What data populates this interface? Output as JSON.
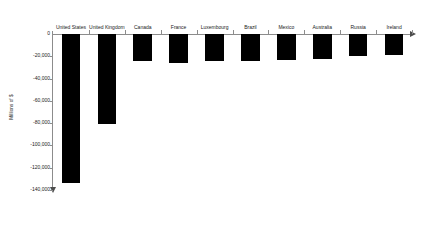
{
  "chart_data": {
    "type": "bar",
    "title": "",
    "subtitle": "",
    "xlabel": "",
    "ylabel": "Millions of $",
    "orientation": "vertical",
    "grid": false,
    "legend": false,
    "legend_position": "none",
    "ylim": [
      -140000,
      0
    ],
    "ytick_step": 20000,
    "categories": [
      "United States",
      "United Kingdom",
      "Canada",
      "France",
      "Luxembourg",
      "Brazil",
      "Mexico",
      "Australia",
      "Russia",
      "Ireland"
    ],
    "values": [
      -134000,
      -81000,
      -24000,
      -26000,
      -24000,
      -24000,
      -23000,
      -22000,
      -20000,
      -19000
    ],
    "ytick_labels": [
      "0",
      "-20,000",
      "-40,000",
      "-60,000",
      "-80,000",
      "-100,000",
      "-120,000",
      "-140,000"
    ],
    "ytick_values": [
      0,
      -20000,
      -40000,
      -60000,
      -80000,
      -100000,
      -120000,
      -140000
    ],
    "bar_color": "#000000",
    "axis_color": "#8c8c8c",
    "background_color": "#ffffff"
  },
  "axis": {
    "y_title": "Millions of $"
  }
}
